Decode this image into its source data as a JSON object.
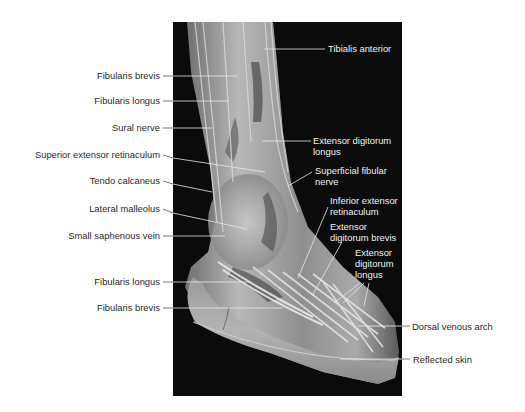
{
  "figure": {
    "colors": {
      "background": "#ffffff",
      "photo_background": "#0b0b0b",
      "label_text_dark": "#2a2a2a",
      "label_text_light": "#f2f2f2",
      "leader_line_dark": "#555555",
      "leader_line_light": "#e8e8e8"
    },
    "labels_left": [
      {
        "id": "fibularis-brevis-upper",
        "text": "Fibularis brevis"
      },
      {
        "id": "fibularis-longus-upper",
        "text": "Fibularis longus"
      },
      {
        "id": "sural-nerve",
        "text": "Sural nerve"
      },
      {
        "id": "superior-extensor-retinaculum",
        "text": "Superior extensor retinaculum"
      },
      {
        "id": "tendo-calcaneus",
        "text": "Tendo calcaneus"
      },
      {
        "id": "lateral-malleolus",
        "text": "Lateral malleolus"
      },
      {
        "id": "small-saphenous-vein",
        "text": "Small saphenous vein"
      },
      {
        "id": "fibularis-longus-lower",
        "text": "Fibularis longus"
      },
      {
        "id": "fibularis-brevis-lower",
        "text": "Fibularis brevis"
      }
    ],
    "labels_right": [
      {
        "id": "tibialis-anterior",
        "text": "Tibialis anterior"
      },
      {
        "id": "extensor-digitorum-longus-upper",
        "line1": "Extensor digitorum",
        "line2": "longus"
      },
      {
        "id": "superficial-fibular-nerve",
        "line1": "Superficial fibular",
        "line2": "nerve"
      },
      {
        "id": "inferior-extensor-retinaculum",
        "line1": "Inferior extensor",
        "line2": "retinaculum"
      },
      {
        "id": "extensor-digitorum-brevis",
        "line1": "Extensor",
        "line2": "digitorum brevis"
      },
      {
        "id": "extensor-digitorum-longus-lower",
        "line1": "Extensor",
        "line2": "digitorum",
        "line3": "longus"
      },
      {
        "id": "dorsal-venous-arch",
        "text": "Dorsal venous arch"
      },
      {
        "id": "reflected-skin",
        "text": "Reflected skin"
      }
    ]
  }
}
